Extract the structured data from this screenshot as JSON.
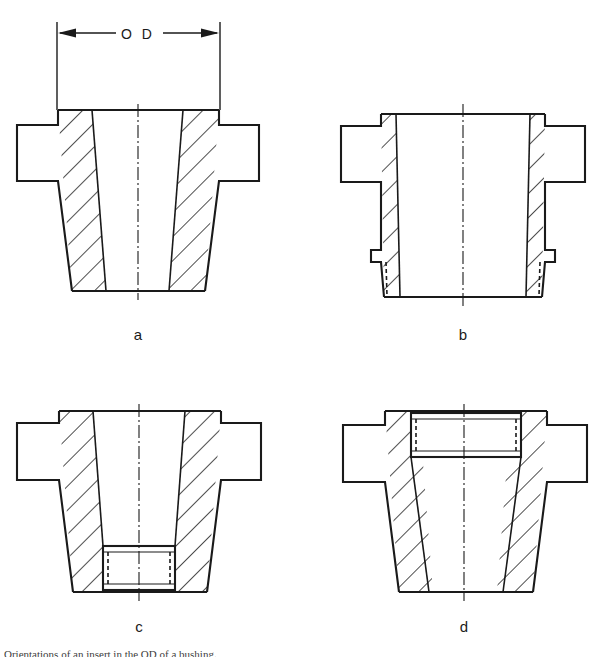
{
  "document": {
    "type": "engineering-sectional-drawing",
    "title": "Bushing / insert configurations sectional views",
    "background_color": "#ffffff",
    "line_color": "#1a1a1a",
    "caption_partial": "Orientations of an insert in the OD of a bushing."
  },
  "dimension": {
    "label": "O D",
    "label_letters": [
      "O",
      "D"
    ],
    "style": "double-arrow-with-extension-lines",
    "applies_to": "figure-a"
  },
  "figures": [
    {
      "id": "a",
      "label": "a",
      "description": "Plain tapered flanged bushing, no insert, no groove",
      "has_insert": false,
      "insert_position": "none"
    },
    {
      "id": "b",
      "label": "b",
      "description": "Flanged bushing with stepped relief groove at the small (bottom) end, hidden lines shown",
      "has_insert": false,
      "insert_position": "none",
      "groove_position": "bottom"
    },
    {
      "id": "c",
      "label": "c",
      "description": "Flanged bushing with rectangular insert seated at the small (bottom) end",
      "has_insert": true,
      "insert_position": "bottom"
    },
    {
      "id": "d",
      "label": "d",
      "description": "Flanged bushing with rectangular insert seated at the large (top / flange) end",
      "has_insert": true,
      "insert_position": "top"
    }
  ],
  "geometry": {
    "hatch_angle_degrees": 45,
    "hatch_spacing_px": 17,
    "section_style": "cross-hatched cut material",
    "figure_a": {
      "flange_left": 17,
      "flange_right": 259,
      "flange_top": 125,
      "flange_bottom": 181,
      "body_top": 110,
      "body_bottom": 291,
      "body_top_left": 58,
      "body_top_right": 219,
      "bore_top_left": 92,
      "bore_top_right": 183,
      "bore_bottom_left": 106,
      "bore_bottom_right": 169,
      "center_x": 138
    },
    "figure_b": {
      "flange_left": 341,
      "flange_right": 585,
      "flange_top": 126,
      "flange_bottom": 182,
      "body_top": 114,
      "body_bottom": 297,
      "center_x": 462
    },
    "figure_c": {
      "flange_left": 17,
      "flange_right": 261,
      "flange_top": 423,
      "flange_bottom": 480,
      "body_top": 411,
      "body_bottom": 592,
      "center_x": 139,
      "insert_top": 546,
      "insert_bottom": 590
    },
    "figure_d": {
      "flange_left": 343,
      "flange_right": 587,
      "flange_top": 425,
      "flange_bottom": 482,
      "body_top": 411,
      "body_bottom": 592,
      "center_x": 464,
      "insert_top": 413,
      "insert_bottom": 457
    }
  }
}
